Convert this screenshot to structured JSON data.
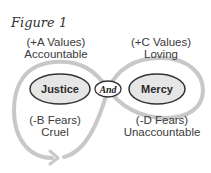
{
  "figure": {
    "caption": "Figure 1",
    "colors": {
      "loop_stroke": "#c8c8c8",
      "node_fill": "#e6e6e6",
      "node_stroke": "#333333",
      "connector_fill": "#ffffff",
      "text": "#3a3a3a"
    },
    "nodes": {
      "left": {
        "label": "Justice"
      },
      "connector": {
        "label": "And"
      },
      "right": {
        "label": "Mercy"
      }
    },
    "quadrants": {
      "top_left": {
        "line1": "(+A Values)",
        "line2": "Accountable"
      },
      "top_right": {
        "line1": "(+C Values)",
        "line2": "Loving"
      },
      "bottom_left": {
        "line1": "(-B Fears)",
        "line2": "Cruel"
      },
      "bottom_right": {
        "line1": "(-D Fears)",
        "line2": "Unaccountable"
      }
    },
    "loop_icon": "infinity-loop-with-arrow"
  }
}
